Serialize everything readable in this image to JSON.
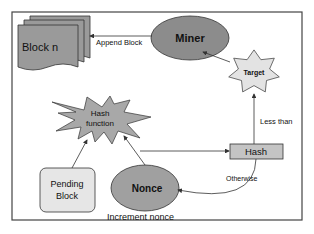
{
  "nodes": {
    "block_n": {
      "label": "Block n"
    },
    "miner": {
      "label": "Miner"
    },
    "target": {
      "label": "Target"
    },
    "hash_function": {
      "line1": "Hash",
      "line2": "function"
    },
    "hash": {
      "label": "Hash"
    },
    "pending_block": {
      "line1": "Pending",
      "line2": "Block"
    },
    "nonce": {
      "label": "Nonce"
    }
  },
  "edges": {
    "append_block": "Append Block",
    "less_than": "Less than",
    "otherwise": "Otherwise",
    "increment_nonce": "Increment nonce"
  },
  "colors": {
    "node_fill": "#a6a6a6",
    "light_fill": "#e8e8e8",
    "hash_fill": "#c8c8c8",
    "stroke": "#333333"
  }
}
